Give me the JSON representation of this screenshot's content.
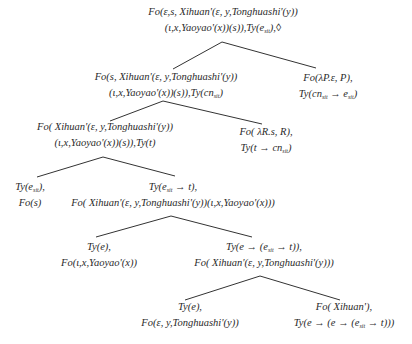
{
  "diagram": {
    "type": "derivation-tree",
    "edge_color": "#333333",
    "nodes": {
      "root": {
        "line1": "Fo(ε,s, Xihuan'(ε, y,Tonghuashi'(y))",
        "line2a": "(ι,x,Yaoyao'(x))(s)),Ty(e",
        "line2_sub": "sit",
        "line2b": "),◊"
      },
      "n2_left": {
        "line1": "Fo(s, Xihuan'(ε, y,Tonghuashi'(y))",
        "line2a": "(ι,x,Yaoyao'(x))(s)),Ty(cn",
        "line2_sub": "sit",
        "line2b": ")"
      },
      "n2_right": {
        "line1": "Fo(λP.ε, P),",
        "line2a": "Ty(cn",
        "line2_sub1": "sit",
        "line2b": " → e",
        "line2_sub2": "sit",
        "line2c": ")"
      },
      "n3_left": {
        "line1": "Fo( Xihuan'(ε, y,Tonghuashi'(y))",
        "line2": "(ι,x,Yaoyao'(x))(s)),Ty(t)"
      },
      "n3_right": {
        "line1": "Fo( λR.s, R),",
        "line2a": "Ty(t → cn",
        "line2_sub": "sit",
        "line2b": ")"
      },
      "n4_left": {
        "line1a": "Ty(e",
        "line1_sub": "sit",
        "line1b": "),",
        "line2": "Fo(s)"
      },
      "n4_right": {
        "line1a": "Ty(e",
        "line1_sub": "sit",
        "line1b": " → t),",
        "line2": "Fo( Xihuan'(ε, y,Tonghuashi'(y))(ι,x,Yaoyao'(x)))"
      },
      "n5_left": {
        "line1": "Ty(e),",
        "line2": "Fo(ι,x,Yaoyao'(x))"
      },
      "n5_right": {
        "line1a": "Ty(e → (e",
        "line1_sub": "sit",
        "line1b": " → t)),",
        "line2": "Fo( Xihuan'(ε, y,Tonghuashi'(y)))"
      },
      "n6_left": {
        "line1": "Ty(e),",
        "line2": "Fo(ε, y,Tonghuashi'(y))"
      },
      "n6_right": {
        "line1": "Fo( Xihuan'),",
        "line2a": "Ty(e → (e → (e",
        "line2_sub": "sit",
        "line2b": " → t)))"
      }
    }
  }
}
